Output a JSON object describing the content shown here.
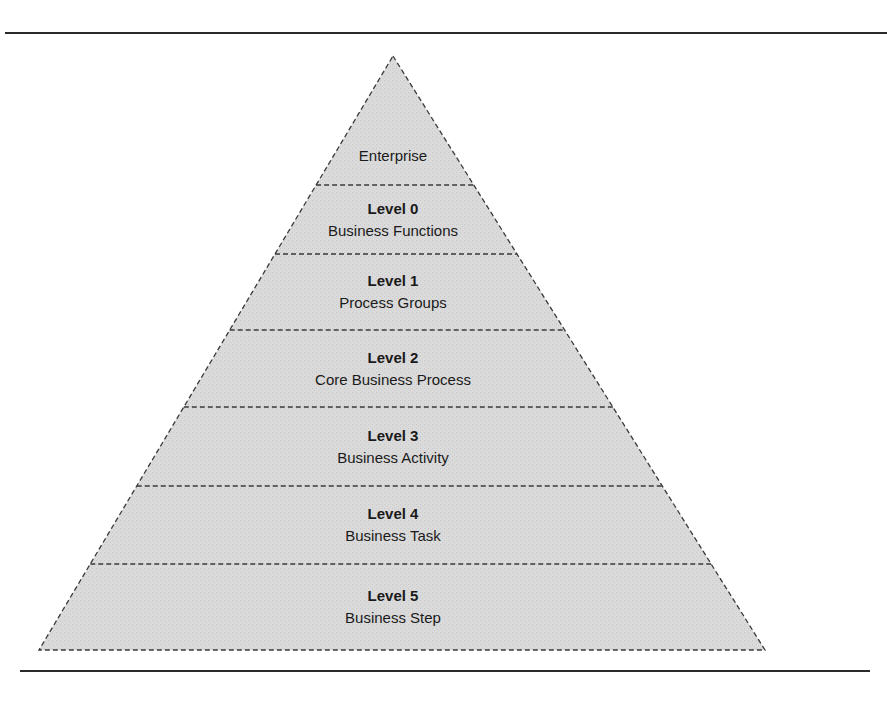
{
  "diagram": {
    "type": "pyramid",
    "fill_color": "#d9d9d9",
    "border_color": "#3a3a3a",
    "border_style": "dashed",
    "apex": {
      "x": 393,
      "y": 56
    },
    "base": {
      "left_x": 39,
      "right_x": 765,
      "y": 650
    },
    "tiers": [
      {
        "level": "",
        "name": "Enterprise",
        "bottom_y": 185
      },
      {
        "level": "Level 0",
        "name": "Business Functions",
        "bottom_y": 254
      },
      {
        "level": "Level 1",
        "name": "Process Groups",
        "bottom_y": 330
      },
      {
        "level": "Level 2",
        "name": "Core Business Process",
        "bottom_y": 407
      },
      {
        "level": "Level 3",
        "name": "Business Activity",
        "bottom_y": 486
      },
      {
        "level": "Level 4",
        "name": "Business Task",
        "bottom_y": 564
      },
      {
        "level": "Level 5",
        "name": "Business Step",
        "bottom_y": 650
      }
    ]
  },
  "rules": [
    {
      "position": "top",
      "y": 33,
      "x1": 5,
      "x2": 887
    },
    {
      "position": "bottom",
      "y": 671,
      "x1": 20,
      "x2": 870
    }
  ]
}
